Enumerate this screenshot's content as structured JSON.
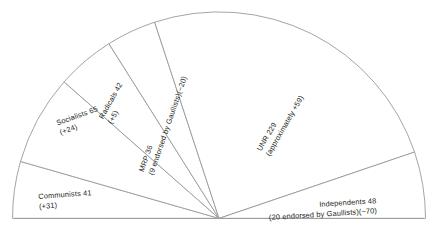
{
  "chart_data": {
    "type": "pie",
    "variant": "semicircle",
    "title": "",
    "subtitle": "",
    "xlabel": "",
    "ylabel": "",
    "total_seats": 461,
    "legend_position": "none",
    "grid": false,
    "orientation": "half-circle, left-to-right, flat side down",
    "categories": [
      "Communists",
      "Socialists",
      "Radicals",
      "MRP",
      "UNR",
      "Independents"
    ],
    "values": [
      41,
      65,
      42,
      36,
      229,
      48
    ],
    "changes": [
      "+31",
      "+24",
      "+5",
      "-20",
      "+59",
      "-70"
    ],
    "slices": [
      {
        "name": "Communists",
        "seats": 41,
        "change": "+31",
        "line1": "Communists 41",
        "line2": "(+31)",
        "angle_deg": 16.0
      },
      {
        "name": "Socialists",
        "seats": 65,
        "change": "+24",
        "line1": "Socialists 65",
        "line2": "(+24)",
        "angle_deg": 25.4
      },
      {
        "name": "Radicals",
        "seats": 42,
        "change": "+5",
        "line1": "Radicals 42",
        "line2": "(+5)",
        "angle_deg": 16.4
      },
      {
        "name": "MRP",
        "seats": 36,
        "change": "-20",
        "line1": "MRP 36",
        "line2": "(9 endorsed by Gaullists)(−20)",
        "angle_deg": 14.1
      },
      {
        "name": "UNR",
        "seats": 229,
        "change": "+59",
        "line1": "UNR 229",
        "line2": "(approximately +59)",
        "angle_deg": 89.4
      },
      {
        "name": "Independents",
        "seats": 48,
        "change": "-70",
        "line1": "Independents 48",
        "line2": "(20 endorsed by Gaullists)(−70)",
        "angle_deg": 18.7
      }
    ],
    "colors": {
      "slice_fill": "#ffffff",
      "slice_stroke": "#9a9a9a",
      "text": "#231f20",
      "background": "#ffffff"
    }
  }
}
